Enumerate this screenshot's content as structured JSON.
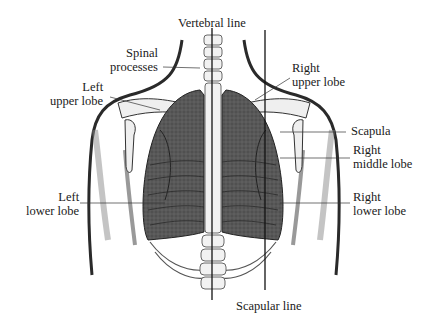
{
  "diagram": {
    "type": "anatomical-illustration",
    "labels": {
      "vertebral_line": "Vertebral line",
      "spinal_processes": [
        "Spinal",
        "processes"
      ],
      "left_upper_lobe": [
        "Left",
        "upper lobe"
      ],
      "right_upper_lobe": [
        "Right",
        "upper lobe"
      ],
      "scapula": "Scapula",
      "right_middle_lobe": [
        "Right",
        "middle lobe"
      ],
      "left_lower_lobe": [
        "Left",
        "lower lobe"
      ],
      "right_lower_lobe": [
        "Right",
        "lower lobe"
      ],
      "scapular_line": "Scapular line"
    },
    "colors": {
      "background": "#ffffff",
      "ink": "#1a1a1a",
      "lung_fill": "#4a4a4a",
      "lung_light": "#6e6e6e",
      "bone": "#e8e8e8",
      "skin_shadow": "#9a9a9a"
    }
  }
}
